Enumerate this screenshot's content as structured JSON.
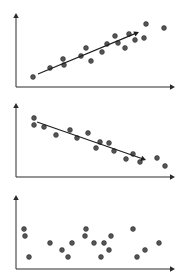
{
  "style": {
    "axis_color": "#2a2a2a",
    "point_color": "#555555",
    "point_stroke": "#2a2a2a",
    "trend_color": "#1e1e1e"
  },
  "chart_data": [
    {
      "type": "scatter",
      "title": "",
      "xlabel": "",
      "ylabel": "",
      "grid": false,
      "legend": null,
      "description": "positive correlation with upward trend arrow",
      "panel": {
        "top": 0,
        "height": 93
      },
      "axes": {
        "origin": [
          16,
          87
        ],
        "x_end": 175,
        "y_end": 13
      },
      "points": [
        [
          33,
          77
        ],
        [
          50,
          68
        ],
        [
          63,
          59
        ],
        [
          64,
          65
        ],
        [
          81,
          56
        ],
        [
          86,
          48
        ],
        [
          91,
          61
        ],
        [
          102,
          52
        ],
        [
          107,
          44
        ],
        [
          115,
          36
        ],
        [
          118,
          43
        ],
        [
          125,
          48
        ],
        [
          129,
          34
        ],
        [
          135,
          40
        ],
        [
          144,
          38
        ],
        [
          146,
          24
        ],
        [
          164,
          28
        ]
      ],
      "trend": {
        "from": [
          38,
          74
        ],
        "to": [
          139,
          32
        ]
      }
    },
    {
      "type": "scatter",
      "title": "",
      "xlabel": "",
      "ylabel": "",
      "grid": false,
      "legend": null,
      "description": "negative correlation with downward trend arrow",
      "panel": {
        "top": 93,
        "height": 93
      },
      "axes": {
        "origin": [
          16,
          177
        ],
        "x_end": 175,
        "y_end": 103
      },
      "points": [
        [
          34,
          118
        ],
        [
          34,
          125
        ],
        [
          44,
          127
        ],
        [
          56,
          135
        ],
        [
          70,
          130
        ],
        [
          77,
          138
        ],
        [
          88,
          133
        ],
        [
          96,
          148
        ],
        [
          100,
          142
        ],
        [
          109,
          143
        ],
        [
          114,
          151
        ],
        [
          126,
          159
        ],
        [
          133,
          154
        ],
        [
          140,
          162
        ],
        [
          157,
          158
        ],
        [
          165,
          166
        ]
      ],
      "trend": {
        "from": [
          37,
          122
        ],
        "to": [
          146,
          160
        ]
      }
    },
    {
      "type": "scatter",
      "title": "",
      "xlabel": "",
      "ylabel": "",
      "grid": false,
      "legend": null,
      "description": "no correlation",
      "panel": {
        "top": 186,
        "height": 93
      },
      "axes": {
        "origin": [
          16,
          269
        ],
        "x_end": 175,
        "y_end": 195
      },
      "points": [
        [
          24,
          229
        ],
        [
          25,
          236
        ],
        [
          29,
          257
        ],
        [
          50,
          243
        ],
        [
          62,
          250
        ],
        [
          68,
          257
        ],
        [
          72,
          243
        ],
        [
          86,
          229
        ],
        [
          85,
          236
        ],
        [
          94,
          243
        ],
        [
          101,
          257
        ],
        [
          104,
          243
        ],
        [
          109,
          250
        ],
        [
          111,
          236
        ],
        [
          133,
          229
        ],
        [
          137,
          257
        ],
        [
          145,
          250
        ],
        [
          159,
          243
        ]
      ],
      "trend": null
    }
  ]
}
